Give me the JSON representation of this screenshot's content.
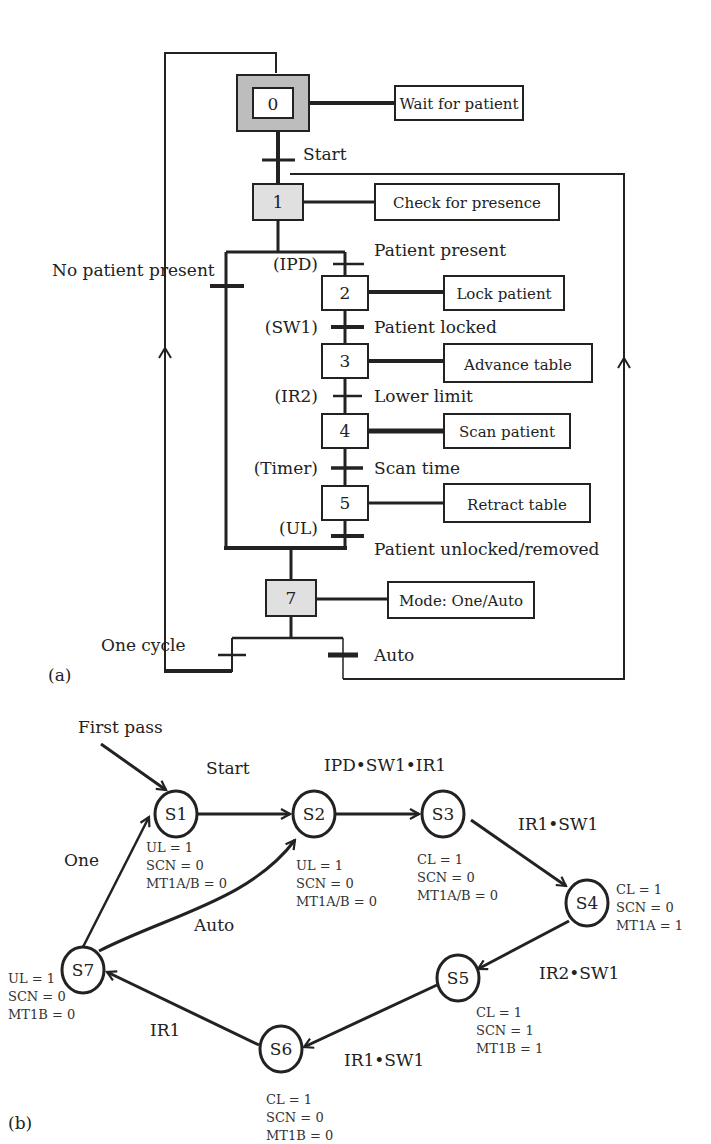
{
  "panel_a": {
    "caption": "(a)",
    "steps": [
      {
        "id": "0",
        "action": "Wait for patient"
      },
      {
        "id": "1",
        "action": "Check for presence"
      },
      {
        "id": "2",
        "action": "Lock patient"
      },
      {
        "id": "3",
        "action": "Advance table"
      },
      {
        "id": "4",
        "action": "Scan patient"
      },
      {
        "id": "5",
        "action": "Retract table"
      },
      {
        "id": "7",
        "action": "Mode: One/Auto"
      }
    ],
    "transitions": {
      "start": "Start",
      "no_patient": "No patient present",
      "ipd_signal": "(IPD)",
      "ipd_label": "Patient present",
      "sw1_signal": "(SW1)",
      "sw1_label": "Patient locked",
      "ir2_signal": "(IR2)",
      "ir2_label": "Lower limit",
      "timer_signal": "(Timer)",
      "timer_label": "Scan time",
      "ul_signal": "(UL)",
      "ul_label": "Patient unlocked/removed",
      "one_cycle": "One cycle",
      "auto": "Auto"
    }
  },
  "panel_b": {
    "caption": "(b)",
    "first_pass": "First pass",
    "states": [
      {
        "id": "S1",
        "outputs": [
          "UL = 1",
          "SCN = 0",
          "MT1A/B = 0"
        ]
      },
      {
        "id": "S2",
        "outputs": [
          "UL = 1",
          "SCN = 0",
          "MT1A/B = 0"
        ]
      },
      {
        "id": "S3",
        "outputs": [
          "CL = 1",
          "SCN = 0",
          "MT1A/B = 0"
        ]
      },
      {
        "id": "S4",
        "outputs": [
          "CL = 1",
          "SCN = 0",
          "MT1A = 1"
        ]
      },
      {
        "id": "S5",
        "outputs": [
          "CL = 1",
          "SCN = 1",
          "MT1B = 1"
        ]
      },
      {
        "id": "S6",
        "outputs": [
          "CL = 1",
          "SCN = 0",
          "MT1B = 0"
        ]
      },
      {
        "id": "S7",
        "outputs": [
          "UL = 1",
          "SCN = 0",
          "MT1B = 0"
        ]
      }
    ],
    "edges": {
      "s1_s2": "Start",
      "s2_s3": "IPD•SW1•IR1",
      "s3_s4": "IR1•SW1",
      "s4_s5": "IR2•SW1",
      "s5_s6": "IR1•SW1",
      "s6_s7": "IR1",
      "s7_s1": "One",
      "s7_s2": "Auto"
    }
  }
}
